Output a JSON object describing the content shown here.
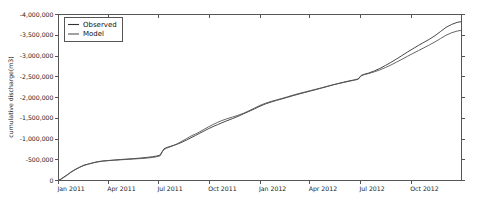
{
  "chart_data": {
    "type": "line",
    "title": "",
    "xlabel": "",
    "ylabel": "cumulative discharge(m3)",
    "grid": false,
    "legend_position": "upper left",
    "xlim": [
      "Jan 2011",
      "Dec 2012"
    ],
    "ylim": [
      0,
      -4000000
    ],
    "y_ticks": [
      0,
      -500000,
      -1000000,
      -1500000,
      -2000000,
      -2500000,
      -3000000,
      -3500000,
      -4000000
    ],
    "y_tick_labels": [
      "0",
      "-500,000",
      "-1,000,000",
      "-1,500,000",
      "-2,000,000",
      "-2,500,000",
      "-3,000,000",
      "-3,500,000",
      "-4,000,000"
    ],
    "x_ticks": [
      0,
      90,
      181,
      273,
      365,
      455,
      547,
      639
    ],
    "x_tick_labels": [
      "Jan 2011",
      "Apr 2011",
      "Jul 2011",
      "Oct 2011",
      "Jan 2012",
      "Apr 2012",
      "Jul 2012",
      "Oct 2012"
    ],
    "x_total_days": 730,
    "series": [
      {
        "name": "Observed",
        "color": "#333333",
        "points": [
          [
            0,
            0
          ],
          [
            5,
            -40000
          ],
          [
            10,
            -85000
          ],
          [
            16,
            -140000
          ],
          [
            22,
            -200000
          ],
          [
            30,
            -265000
          ],
          [
            38,
            -320000
          ],
          [
            46,
            -368000
          ],
          [
            55,
            -400000
          ],
          [
            64,
            -432000
          ],
          [
            72,
            -455000
          ],
          [
            80,
            -470000
          ],
          [
            90,
            -482000
          ],
          [
            100,
            -492000
          ],
          [
            112,
            -505000
          ],
          [
            124,
            -516000
          ],
          [
            136,
            -527000
          ],
          [
            148,
            -540000
          ],
          [
            160,
            -556000
          ],
          [
            170,
            -572000
          ],
          [
            178,
            -590000
          ],
          [
            184,
            -612000
          ],
          [
            188,
            -700000
          ],
          [
            191,
            -760000
          ],
          [
            195,
            -790000
          ],
          [
            200,
            -812000
          ],
          [
            208,
            -845000
          ],
          [
            216,
            -880000
          ],
          [
            224,
            -925000
          ],
          [
            232,
            -975000
          ],
          [
            240,
            -1030000
          ],
          [
            248,
            -1085000
          ],
          [
            256,
            -1140000
          ],
          [
            264,
            -1195000
          ],
          [
            272,
            -1250000
          ],
          [
            280,
            -1300000
          ],
          [
            288,
            -1345000
          ],
          [
            296,
            -1390000
          ],
          [
            305,
            -1440000
          ],
          [
            315,
            -1490000
          ],
          [
            325,
            -1545000
          ],
          [
            335,
            -1605000
          ],
          [
            345,
            -1665000
          ],
          [
            355,
            -1725000
          ],
          [
            365,
            -1790000
          ],
          [
            375,
            -1845000
          ],
          [
            385,
            -1890000
          ],
          [
            395,
            -1930000
          ],
          [
            405,
            -1968000
          ],
          [
            415,
            -2005000
          ],
          [
            425,
            -2045000
          ],
          [
            436,
            -2085000
          ],
          [
            446,
            -2120000
          ],
          [
            456,
            -2155000
          ],
          [
            466,
            -2190000
          ],
          [
            476,
            -2225000
          ],
          [
            486,
            -2262000
          ],
          [
            496,
            -2300000
          ],
          [
            506,
            -2335000
          ],
          [
            516,
            -2368000
          ],
          [
            526,
            -2398000
          ],
          [
            536,
            -2425000
          ],
          [
            543,
            -2448000
          ],
          [
            548,
            -2530000
          ],
          [
            554,
            -2560000
          ],
          [
            562,
            -2590000
          ],
          [
            572,
            -2640000
          ],
          [
            582,
            -2700000
          ],
          [
            592,
            -2770000
          ],
          [
            602,
            -2845000
          ],
          [
            612,
            -2925000
          ],
          [
            622,
            -3010000
          ],
          [
            632,
            -3095000
          ],
          [
            642,
            -3175000
          ],
          [
            652,
            -3255000
          ],
          [
            662,
            -3330000
          ],
          [
            672,
            -3405000
          ],
          [
            682,
            -3490000
          ],
          [
            692,
            -3590000
          ],
          [
            702,
            -3690000
          ],
          [
            712,
            -3760000
          ],
          [
            722,
            -3810000
          ],
          [
            730,
            -3830000
          ]
        ]
      },
      {
        "name": "Model",
        "color": "#555555",
        "points": [
          [
            0,
            0
          ],
          [
            5,
            -35000
          ],
          [
            10,
            -78000
          ],
          [
            16,
            -132000
          ],
          [
            22,
            -192000
          ],
          [
            30,
            -258000
          ],
          [
            38,
            -315000
          ],
          [
            46,
            -362000
          ],
          [
            55,
            -398000
          ],
          [
            64,
            -428000
          ],
          [
            72,
            -450000
          ],
          [
            80,
            -466000
          ],
          [
            90,
            -478000
          ],
          [
            100,
            -488000
          ],
          [
            112,
            -498000
          ],
          [
            124,
            -508000
          ],
          [
            136,
            -518000
          ],
          [
            148,
            -528000
          ],
          [
            160,
            -540000
          ],
          [
            170,
            -555000
          ],
          [
            178,
            -572000
          ],
          [
            184,
            -595000
          ],
          [
            188,
            -690000
          ],
          [
            191,
            -745000
          ],
          [
            195,
            -775000
          ],
          [
            200,
            -800000
          ],
          [
            208,
            -840000
          ],
          [
            216,
            -890000
          ],
          [
            224,
            -950000
          ],
          [
            232,
            -1010000
          ],
          [
            240,
            -1070000
          ],
          [
            248,
            -1120000
          ],
          [
            256,
            -1175000
          ],
          [
            264,
            -1235000
          ],
          [
            272,
            -1295000
          ],
          [
            280,
            -1350000
          ],
          [
            288,
            -1400000
          ],
          [
            296,
            -1445000
          ],
          [
            305,
            -1488000
          ],
          [
            315,
            -1528000
          ],
          [
            325,
            -1570000
          ],
          [
            335,
            -1620000
          ],
          [
            345,
            -1680000
          ],
          [
            355,
            -1745000
          ],
          [
            365,
            -1810000
          ],
          [
            375,
            -1862000
          ],
          [
            385,
            -1905000
          ],
          [
            395,
            -1942000
          ],
          [
            405,
            -1978000
          ],
          [
            415,
            -2018000
          ],
          [
            425,
            -2058000
          ],
          [
            436,
            -2098000
          ],
          [
            446,
            -2132000
          ],
          [
            456,
            -2165000
          ],
          [
            466,
            -2198000
          ],
          [
            476,
            -2232000
          ],
          [
            486,
            -2268000
          ],
          [
            496,
            -2302000
          ],
          [
            506,
            -2332000
          ],
          [
            516,
            -2360000
          ],
          [
            526,
            -2390000
          ],
          [
            536,
            -2418000
          ],
          [
            543,
            -2440000
          ],
          [
            548,
            -2520000
          ],
          [
            554,
            -2552000
          ],
          [
            562,
            -2578000
          ],
          [
            572,
            -2618000
          ],
          [
            582,
            -2665000
          ],
          [
            592,
            -2720000
          ],
          [
            602,
            -2782000
          ],
          [
            612,
            -2850000
          ],
          [
            622,
            -2920000
          ],
          [
            632,
            -2992000
          ],
          [
            642,
            -3062000
          ],
          [
            652,
            -3130000
          ],
          [
            662,
            -3198000
          ],
          [
            672,
            -3268000
          ],
          [
            682,
            -3340000
          ],
          [
            692,
            -3420000
          ],
          [
            702,
            -3500000
          ],
          [
            712,
            -3560000
          ],
          [
            722,
            -3600000
          ],
          [
            730,
            -3620000
          ]
        ]
      }
    ],
    "legend": [
      {
        "label": "Observed",
        "color": "#333333"
      },
      {
        "label": "Model",
        "color": "#555555"
      }
    ]
  }
}
